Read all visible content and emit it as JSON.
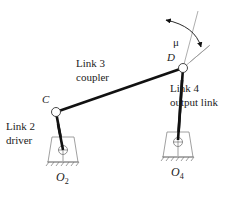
{
  "diagram": {
    "labels": {
      "link3_line1": "Link 3",
      "link3_line2": "coupler",
      "link2_line1": "Link 2",
      "link2_line2": "driver",
      "link4_line1": "Link 4",
      "link4_line2": "output link",
      "joint_c": "C",
      "joint_d": "D",
      "ground_o2": "O",
      "ground_o2_sub": "2",
      "ground_o4": "O",
      "ground_o4_sub": "4",
      "angle": "μ"
    },
    "colors": {
      "link": "#111111",
      "thin": "#888888",
      "text": "#222222"
    }
  }
}
